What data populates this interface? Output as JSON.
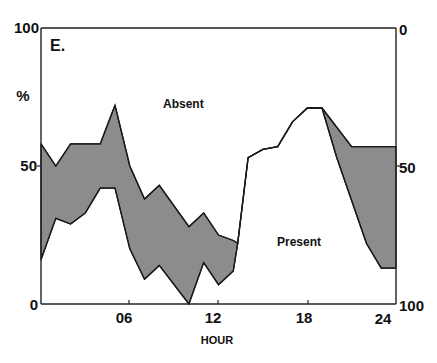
{
  "chart_data": {
    "type": "area",
    "title": "E.",
    "xlabel": "HOUR",
    "ylabel_left": "%",
    "ylabel_right": "",
    "xlim": [
      0,
      24
    ],
    "ylim_left": [
      0,
      100
    ],
    "ylim_right": [
      100,
      0
    ],
    "x_ticks": [
      "06",
      "12",
      "18",
      "24"
    ],
    "y_ticks_left": [
      "0",
      "50",
      "100"
    ],
    "y_ticks_right": [
      "0",
      "50",
      "100"
    ],
    "grid": false,
    "annotations": [
      {
        "text": "Absent",
        "x": 9.0,
        "y": 72
      },
      {
        "text": "Present",
        "x": 16.4,
        "y": 23
      }
    ],
    "series": [
      {
        "name": "Upper boundary (Absent above)",
        "points": [
          [
            0,
            58
          ],
          [
            1,
            50
          ],
          [
            2,
            58
          ],
          [
            4,
            58
          ],
          [
            5,
            72
          ],
          [
            6,
            50
          ],
          [
            7,
            38
          ],
          [
            8,
            43
          ],
          [
            10,
            28
          ],
          [
            11,
            33
          ],
          [
            12,
            25
          ],
          [
            13,
            23
          ],
          [
            13.3,
            22
          ],
          [
            14,
            53
          ],
          [
            15,
            56
          ],
          [
            16,
            57
          ],
          [
            17,
            66
          ],
          [
            18,
            71
          ],
          [
            19,
            71
          ],
          [
            21,
            57
          ],
          [
            24,
            57
          ]
        ]
      },
      {
        "name": "Lower boundary (Present below)",
        "points": [
          [
            0,
            16
          ],
          [
            1,
            31
          ],
          [
            2,
            29
          ],
          [
            3,
            33
          ],
          [
            4,
            42
          ],
          [
            5,
            42
          ],
          [
            6,
            20
          ],
          [
            7,
            9
          ],
          [
            8,
            14
          ],
          [
            10,
            0
          ],
          [
            11,
            15
          ],
          [
            12,
            7
          ],
          [
            13,
            12
          ],
          [
            13.3,
            22
          ],
          [
            14,
            53
          ],
          [
            15,
            56
          ],
          [
            16,
            57
          ],
          [
            17,
            66
          ],
          [
            18,
            71
          ],
          [
            19,
            71
          ],
          [
            20,
            53
          ],
          [
            22,
            22
          ],
          [
            23,
            13
          ],
          [
            24,
            13
          ]
        ]
      }
    ],
    "fill_between_color": "#8a8a8a"
  },
  "labels": {
    "panel": "E.",
    "percent": "%",
    "absent": "Absent",
    "present": "Present",
    "x_axis_title": "HOUR",
    "left_100": "100",
    "left_50": "50",
    "left_0": "0",
    "right_0": "0",
    "right_50": "50",
    "right_100": "100",
    "x_06": "06",
    "x_12": "12",
    "x_18": "18",
    "x_24": "24"
  },
  "colors": {
    "fill": "#8c8c8c",
    "line": "#1a1a1a",
    "background": "#ffffff"
  }
}
